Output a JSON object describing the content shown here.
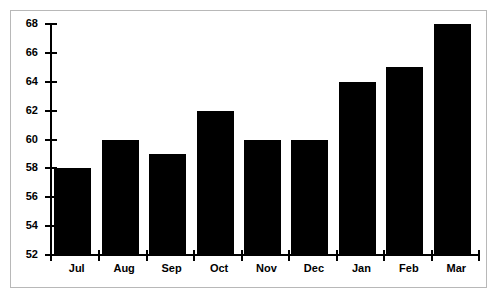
{
  "chart_data": {
    "type": "bar",
    "title": "",
    "subtitle": "",
    "xlabel": "",
    "ylabel": "",
    "categories": [
      "Jul",
      "Aug",
      "Sep",
      "Oct",
      "Nov",
      "Dec",
      "Jan",
      "Feb",
      "Mar"
    ],
    "values": [
      58,
      60,
      59,
      62,
      60,
      60,
      64,
      65,
      68
    ],
    "ylim": [
      52,
      68
    ],
    "ytick_values": [
      52,
      54,
      56,
      58,
      60,
      62,
      64,
      66,
      68
    ],
    "ytick_labels": [
      "52",
      "54",
      "56",
      "58",
      "60",
      "62",
      "64",
      "66",
      "68"
    ],
    "ytick_step": 2,
    "grid": false,
    "legend": false,
    "legend_position": "none",
    "bar_color": "#000000",
    "plot_background": "#ffffff",
    "frame_color": "#b8b8b8",
    "axis_color": "#000000"
  }
}
